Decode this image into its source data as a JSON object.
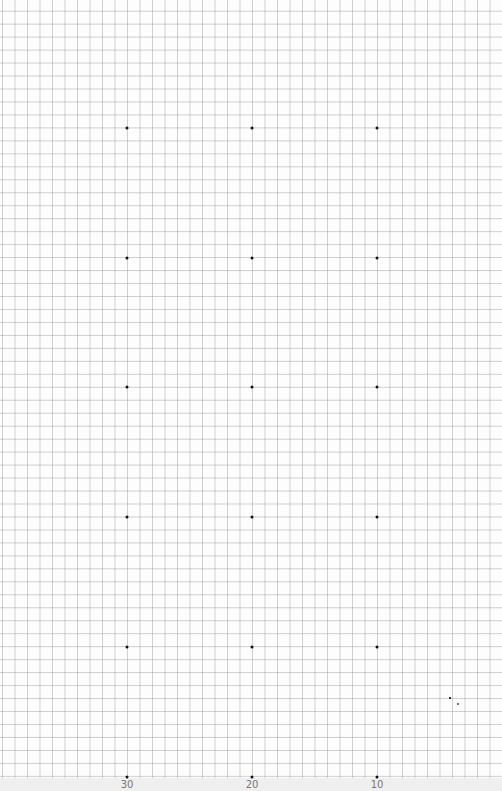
{
  "chart_data": {
    "type": "scatter",
    "title": "",
    "xlabel": "",
    "ylabel": "",
    "grid": true,
    "x_ticks": [
      30,
      20,
      10
    ],
    "x_tick_pixels": [
      127,
      252,
      377
    ],
    "row_pixels": [
      128,
      258,
      387,
      517,
      647,
      777
    ],
    "points": [
      {
        "x": 30,
        "row": 0
      },
      {
        "x": 20,
        "row": 0
      },
      {
        "x": 10,
        "row": 0
      },
      {
        "x": 30,
        "row": 1
      },
      {
        "x": 20,
        "row": 1
      },
      {
        "x": 10,
        "row": 1
      },
      {
        "x": 30,
        "row": 2
      },
      {
        "x": 20,
        "row": 2
      },
      {
        "x": 10,
        "row": 2
      },
      {
        "x": 30,
        "row": 3
      },
      {
        "x": 20,
        "row": 3
      },
      {
        "x": 10,
        "row": 3
      },
      {
        "x": 30,
        "row": 4
      },
      {
        "x": 20,
        "row": 4
      },
      {
        "x": 10,
        "row": 4
      },
      {
        "x": 30,
        "row": 5
      },
      {
        "x": 20,
        "row": 5
      },
      {
        "x": 10,
        "row": 5
      }
    ]
  },
  "labels": {
    "tick_30": "30",
    "tick_20": "20",
    "tick_10": "10"
  },
  "colors": {
    "grid": "#a0a0a0",
    "dot": "#111111",
    "label": "#777777"
  }
}
